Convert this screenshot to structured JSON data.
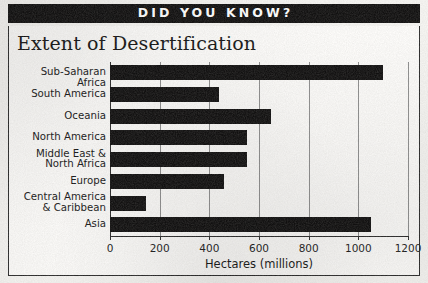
{
  "banner": {
    "text": "DID YOU KNOW?"
  },
  "chart_data": {
    "type": "bar",
    "orientation": "horizontal",
    "title": "Extent of Desertification",
    "xlabel": "Hectares (millions)",
    "ylabel": "",
    "xlim": [
      0,
      1200
    ],
    "xticks": [
      0,
      200,
      400,
      600,
      800,
      1000,
      1200
    ],
    "xtick_labels": [
      "0",
      "200",
      "400",
      "600",
      "800",
      "1000",
      "1200"
    ],
    "grid": true,
    "grid_axis": "x",
    "legend": "none",
    "bar_color": "#111010",
    "categories": [
      "Sub-Saharan Africa",
      "South America",
      "Oceania",
      "North America",
      "Middle East &\nNorth Africa",
      "Europe",
      "Central America\n& Caribbean",
      "Asia"
    ],
    "values": [
      1100,
      440,
      650,
      550,
      550,
      460,
      145,
      1050
    ]
  }
}
